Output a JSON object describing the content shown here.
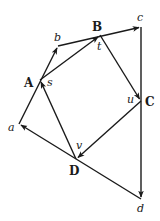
{
  "diagram": {
    "stroke_color": "#1a1a1a",
    "outer_points": {
      "a": {
        "label": "a",
        "x": 19,
        "y": 124
      },
      "b": {
        "label": "b",
        "x": 58,
        "y": 46
      },
      "c": {
        "label": "c",
        "x": 141,
        "y": 27
      },
      "d": {
        "label": "d",
        "x": 141,
        "y": 199
      }
    },
    "inner_points": {
      "A": {
        "label": "A",
        "x": 40,
        "y": 80
      },
      "B": {
        "label": "B",
        "x": 100,
        "y": 35
      },
      "C": {
        "label": "C",
        "x": 141,
        "y": 101
      },
      "D": {
        "label": "D",
        "x": 76,
        "y": 159
      }
    },
    "midpoint_labels": {
      "s": "s",
      "t": "t",
      "u": "u",
      "v": "v"
    },
    "edges": [
      {
        "from": "a",
        "to": "b",
        "arrow": "end"
      },
      {
        "from": "b",
        "to": "c",
        "arrow": "end"
      },
      {
        "from": "c",
        "to": "d",
        "arrow": "end"
      },
      {
        "from": "d",
        "to": "a",
        "arrow": "end"
      },
      {
        "from": "A",
        "to": "B",
        "arrow": "end"
      },
      {
        "from": "B",
        "to": "C",
        "arrow": "end"
      },
      {
        "from": "C",
        "to": "D",
        "arrow": "end"
      },
      {
        "from": "D",
        "to": "A",
        "arrow": "end"
      }
    ]
  }
}
